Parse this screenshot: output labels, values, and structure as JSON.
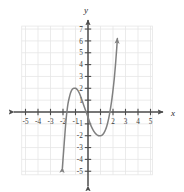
{
  "chart_data": {
    "type": "line",
    "title": "",
    "subtitle": "",
    "xlabel": "x",
    "ylabel": "y",
    "xlim": [
      -5.3,
      5.6
    ],
    "ylim": [
      -5.4,
      7.3
    ],
    "grid": true,
    "grid_color": "#e6e6e6",
    "legend": "none",
    "curve_color": "#808080",
    "axis_color": "#4d4d4d",
    "x_ticks": [
      -5,
      -4,
      -3,
      -2,
      -1,
      1,
      2,
      3,
      4,
      5
    ],
    "x_tick_labels": [
      "-5",
      "-4",
      "-3",
      "-2",
      "-1",
      "1",
      "2",
      "3",
      "4",
      "5"
    ],
    "y_ticks": [
      7,
      6,
      5,
      4,
      3,
      2,
      1,
      -1,
      -2,
      -3,
      -4,
      -5
    ],
    "y_tick_labels": [
      "7",
      "6",
      "5",
      "4",
      "3",
      "2",
      "1",
      "-1",
      "-2",
      "-3",
      "-4",
      "-5"
    ],
    "series": [
      {
        "name": "cubic",
        "description": "Cubic polynomial with local maximum near (-1, 2) and local minimum near (1.1, -2)",
        "arrow_start": true,
        "arrow_end": true,
        "local_maximum": [
          -1,
          2
        ],
        "local_minimum": [
          1.1,
          -2
        ],
        "roots": [
          -1.8,
          0,
          2
        ],
        "points": [
          [
            -2.05,
            -4.7
          ],
          [
            -2.0,
            -4.0
          ],
          [
            -1.95,
            -3.3
          ],
          [
            -1.9,
            -2.6
          ],
          [
            -1.85,
            -1.9
          ],
          [
            -1.8,
            -1.2
          ],
          [
            -1.75,
            -0.6
          ],
          [
            -1.7,
            -0.1
          ],
          [
            -1.6,
            0.7
          ],
          [
            -1.5,
            1.2
          ],
          [
            -1.4,
            1.6
          ],
          [
            -1.3,
            1.85
          ],
          [
            -1.2,
            1.97
          ],
          [
            -1.1,
            2.0
          ],
          [
            -1.0,
            2.0
          ],
          [
            -0.9,
            1.93
          ],
          [
            -0.8,
            1.8
          ],
          [
            -0.7,
            1.6
          ],
          [
            -0.6,
            1.35
          ],
          [
            -0.5,
            1.05
          ],
          [
            -0.4,
            0.75
          ],
          [
            -0.3,
            0.45
          ],
          [
            -0.2,
            0.15
          ],
          [
            -0.1,
            -0.15
          ],
          [
            0.0,
            -0.45
          ],
          [
            0.1,
            -0.75
          ],
          [
            0.2,
            -1.05
          ],
          [
            0.3,
            -1.3
          ],
          [
            0.4,
            -1.5
          ],
          [
            0.5,
            -1.68
          ],
          [
            0.6,
            -1.82
          ],
          [
            0.7,
            -1.92
          ],
          [
            0.8,
            -1.98
          ],
          [
            0.9,
            -2.0
          ],
          [
            1.0,
            -2.0
          ],
          [
            1.1,
            -1.97
          ],
          [
            1.2,
            -1.88
          ],
          [
            1.3,
            -1.72
          ],
          [
            1.4,
            -1.5
          ],
          [
            1.5,
            -1.2
          ],
          [
            1.6,
            -0.8
          ],
          [
            1.7,
            -0.3
          ],
          [
            1.8,
            0.3
          ],
          [
            1.9,
            1.0
          ],
          [
            2.0,
            1.85
          ],
          [
            2.1,
            2.8
          ],
          [
            2.15,
            3.4
          ],
          [
            2.2,
            4.0
          ],
          [
            2.25,
            4.7
          ],
          [
            2.3,
            5.4
          ],
          [
            2.35,
            6.2
          ]
        ]
      }
    ]
  },
  "axes": {
    "x_axis_label": "x",
    "y_axis_label": "y"
  }
}
